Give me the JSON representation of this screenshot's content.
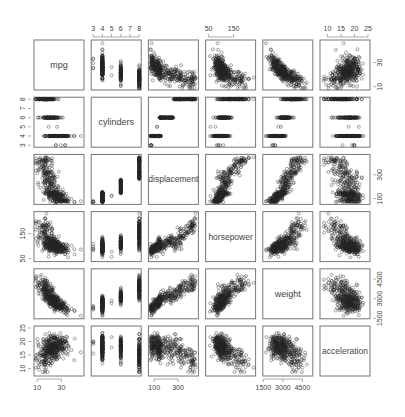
{
  "chart_data": {
    "type": "scatter",
    "subtype": "scatterplot-matrix",
    "title": "",
    "variables": [
      "mpg",
      "cylinders",
      "displacement",
      "horsepower",
      "weight",
      "acceleration"
    ],
    "ranges": {
      "mpg": [
        9,
        47
      ],
      "cylinders": [
        3,
        8
      ],
      "displacement": [
        68,
        455
      ],
      "horsepower": [
        46,
        230
      ],
      "weight": [
        1613,
        5140
      ],
      "acceleration": [
        8,
        25
      ]
    },
    "axes": {
      "top": [
        {
          "var": "cylinders",
          "ticks": [
            "3",
            "4",
            "5",
            "6",
            "7",
            "8"
          ]
        },
        {
          "var": "horsepower",
          "ticks": [
            "50",
            "150"
          ]
        },
        {
          "var": "acceleration",
          "ticks": [
            "10",
            "15",
            "20",
            "25"
          ]
        }
      ],
      "bottom": [
        {
          "var": "mpg",
          "ticks": [
            "10",
            "30"
          ]
        },
        {
          "var": "displacement",
          "ticks": [
            "100",
            "300"
          ]
        },
        {
          "var": "weight",
          "ticks": [
            "1500",
            "3000",
            "4500"
          ]
        }
      ],
      "left": [
        {
          "var": "cylinders",
          "ticks": [
            "3",
            "4",
            "5",
            "6",
            "7",
            "8"
          ]
        },
        {
          "var": "horsepower",
          "ticks": [
            "50",
            "150"
          ]
        },
        {
          "var": "acceleration",
          "ticks": [
            "10",
            "15",
            "20",
            "25"
          ]
        }
      ],
      "right": [
        {
          "var": "mpg",
          "ticks": [
            "10",
            "30"
          ]
        },
        {
          "var": "displacement",
          "ticks": [
            "100",
            "300"
          ]
        },
        {
          "var": "weight",
          "ticks": [
            "1500",
            "3000",
            "4500"
          ]
        }
      ]
    },
    "grid": false,
    "legend": null,
    "point_style": "open-circle",
    "sample_size_estimate": 392
  },
  "colors": {
    "point": "#222222",
    "box": "#777777",
    "text": "#444444"
  }
}
